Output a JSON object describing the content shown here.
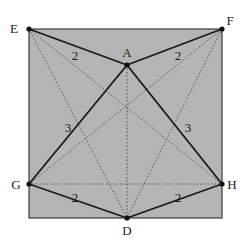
{
  "diagram": {
    "colors": {
      "square_fill": "#b5b5b5",
      "square_stroke": "#3a3a3a",
      "solid_line": "#1a1a1a",
      "dotted_line": "#4a4a4a",
      "point": "#111111"
    },
    "square": {
      "x": 29,
      "y": 29,
      "width": 193,
      "height": 189
    },
    "points": [
      {
        "id": "E",
        "label": "E",
        "x": 29,
        "y": 29,
        "label_x": 14,
        "label_y": 33,
        "anchor": "middle"
      },
      {
        "id": "F",
        "label": "F",
        "x": 222,
        "y": 29,
        "label_x": 230,
        "label_y": 25,
        "anchor": "middle"
      },
      {
        "id": "A",
        "label": "A",
        "x": 127,
        "y": 65,
        "label_x": 127,
        "label_y": 57,
        "anchor": "middle"
      },
      {
        "id": "G",
        "label": "G",
        "x": 29,
        "y": 184,
        "label_x": 16,
        "label_y": 189,
        "anchor": "middle"
      },
      {
        "id": "H",
        "label": "H",
        "x": 222,
        "y": 184,
        "label_x": 232,
        "label_y": 189,
        "anchor": "middle"
      },
      {
        "id": "D",
        "label": "D",
        "x": 127,
        "y": 218,
        "label_x": 127,
        "label_y": 235,
        "anchor": "middle"
      }
    ],
    "solid_segments": [
      {
        "from": "E",
        "to": "A",
        "x1": 29,
        "y1": 29,
        "x2": 127,
        "y2": 65
      },
      {
        "from": "A",
        "to": "F",
        "x1": 127,
        "y1": 65,
        "x2": 222,
        "y2": 29
      },
      {
        "from": "A",
        "to": "G",
        "x1": 127,
        "y1": 65,
        "x2": 29,
        "y2": 184
      },
      {
        "from": "A",
        "to": "H",
        "x1": 127,
        "y1": 65,
        "x2": 222,
        "y2": 184
      },
      {
        "from": "G",
        "to": "D",
        "x1": 29,
        "y1": 184,
        "x2": 127,
        "y2": 218
      },
      {
        "from": "D",
        "to": "H",
        "x1": 127,
        "y1": 218,
        "x2": 222,
        "y2": 184
      }
    ],
    "dotted_segments": [
      {
        "from": "E",
        "to": "H",
        "x1": 29,
        "y1": 29,
        "x2": 222,
        "y2": 184
      },
      {
        "from": "F",
        "to": "G",
        "x1": 222,
        "y1": 29,
        "x2": 29,
        "y2": 184
      },
      {
        "from": "E",
        "to": "D",
        "x1": 29,
        "y1": 29,
        "x2": 127,
        "y2": 218
      },
      {
        "from": "F",
        "to": "D",
        "x1": 222,
        "y1": 29,
        "x2": 127,
        "y2": 218
      },
      {
        "from": "A",
        "to": "D",
        "x1": 127,
        "y1": 65,
        "x2": 127,
        "y2": 218
      },
      {
        "from": "G",
        "to": "H",
        "x1": 29,
        "y1": 184,
        "x2": 222,
        "y2": 184
      }
    ],
    "length_labels": [
      {
        "segment": "EA",
        "text": "2",
        "x": 75,
        "y": 60
      },
      {
        "segment": "AF",
        "text": "2",
        "x": 178,
        "y": 60
      },
      {
        "segment": "AG",
        "text": "3",
        "x": 68,
        "y": 132
      },
      {
        "segment": "AH",
        "text": "3",
        "x": 188,
        "y": 132
      },
      {
        "segment": "GD",
        "text": "2",
        "x": 75,
        "y": 202
      },
      {
        "segment": "DH",
        "text": "2",
        "x": 178,
        "y": 202
      }
    ]
  }
}
